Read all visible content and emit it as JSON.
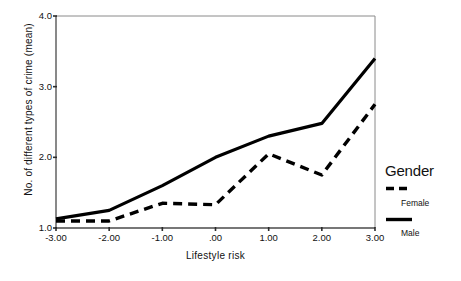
{
  "chart_data": {
    "type": "line",
    "title": "",
    "xlabel": "Lifestyle risk",
    "ylabel": "No. of different types of crime (mean)",
    "x": [
      -3.0,
      -2.0,
      -1.0,
      0.0,
      1.0,
      2.0,
      3.0
    ],
    "xtick_labels": [
      "-3.00",
      "-2.00",
      "-1.00",
      ".00",
      "1.00",
      "2.00",
      "3.00"
    ],
    "ytick_labels": [
      "1.0",
      "2.0",
      "3.0",
      "4.0"
    ],
    "yticks": [
      1.0,
      2.0,
      3.0,
      4.0
    ],
    "xlim": [
      -3.0,
      3.0
    ],
    "ylim": [
      1.0,
      4.0
    ],
    "grid": false,
    "legend_position": "right",
    "series": [
      {
        "name": "Male",
        "style": "solid",
        "color": "#000000",
        "values": [
          1.13,
          1.25,
          1.6,
          2.0,
          2.3,
          2.48,
          3.4
        ]
      },
      {
        "name": "Female",
        "style": "dashed",
        "color": "#000000",
        "values": [
          1.1,
          1.1,
          1.35,
          1.33,
          2.05,
          1.75,
          2.75
        ]
      }
    ]
  },
  "legend": {
    "title": "Gender",
    "entries": [
      {
        "label": "Female",
        "style": "dashed"
      },
      {
        "label": "Male",
        "style": "solid"
      }
    ]
  },
  "axes": {
    "x_title": "Lifestyle risk",
    "y_title": "No. of different types of crime (mean)"
  }
}
